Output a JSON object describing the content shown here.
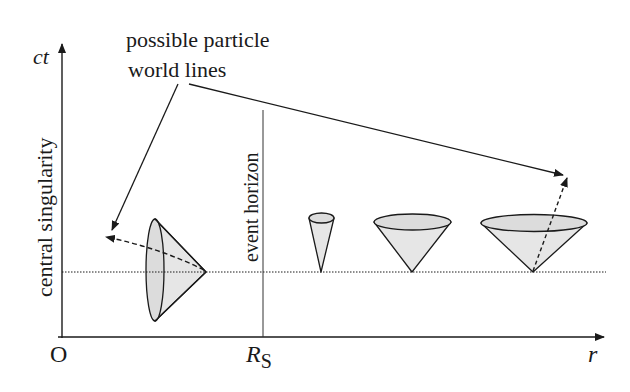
{
  "figure": {
    "title_annotation": {
      "line1": "possible particle",
      "line2": "world lines"
    },
    "axes": {
      "y_label": "ct",
      "x_label": "r",
      "origin_label": "O",
      "rs_label_main": "R",
      "rs_label_sub": "S"
    },
    "vertical_labels": {
      "singularity": "central singularity",
      "horizon": "event horizon"
    },
    "colors": {
      "ink": "#1a1a1a",
      "cone_fill": "#e6e6e6",
      "cone_rim_fill": "#dcdcdc",
      "background": "#ffffff"
    },
    "light_cones": [
      {
        "id": "inside-horizon",
        "orientation": "tipped-left",
        "apex_x": 206,
        "apex_y": 272
      },
      {
        "id": "near-horizon",
        "orientation": "upright-narrow",
        "apex_x": 321,
        "apex_y": 272
      },
      {
        "id": "medium-distance",
        "orientation": "upright",
        "apex_x": 412,
        "apex_y": 272
      },
      {
        "id": "far-distance",
        "orientation": "upright-wide",
        "apex_x": 533,
        "apex_y": 272
      }
    ]
  }
}
